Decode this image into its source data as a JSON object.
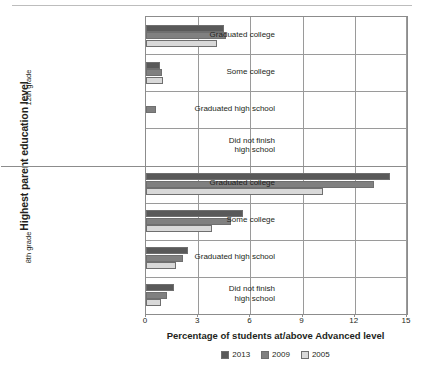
{
  "chart_data": {
    "type": "bar",
    "orientation": "horizontal",
    "title": "",
    "xlabel": "Percentage of students at/above Advanced level",
    "ylabel": "Highest parent education level",
    "xlim": [
      0,
      15
    ],
    "xticks": [
      0,
      3,
      6,
      9,
      12,
      15
    ],
    "xtick_labels": [
      "0",
      "3",
      "6",
      "9",
      "12",
      "15"
    ],
    "grid": "vertical-and-horizontal",
    "legend_position": "bottom-center",
    "group_labels": [
      "12th grade",
      "8th grade"
    ],
    "categories": [
      "Graduated college",
      "Some college",
      "Graduated high school",
      "Did not finish\nhigh school"
    ],
    "groups": [
      {
        "name": "12th grade",
        "categories": [
          "Graduated college",
          "Some college",
          "Graduated high school",
          "Did not finish high school"
        ],
        "series": [
          {
            "name": "2013",
            "color": "#595959",
            "values": [
              4.5,
              0.8,
              0.0,
              0.0
            ]
          },
          {
            "name": "2009",
            "color": "#808080",
            "values": [
              4.6,
              0.9,
              0.6,
              0.0
            ]
          },
          {
            "name": "2005",
            "color": "#d9d9d9",
            "values": [
              4.1,
              1.0,
              0.0,
              0.0
            ]
          }
        ]
      },
      {
        "name": "8th grade",
        "categories": [
          "Graduated college",
          "Some college",
          "Graduated high school",
          "Did not finish high school"
        ],
        "series": [
          {
            "name": "2013",
            "color": "#595959",
            "values": [
              14.0,
              5.6,
              2.4,
              1.6
            ]
          },
          {
            "name": "2009",
            "color": "#808080",
            "values": [
              13.1,
              4.9,
              2.1,
              1.2
            ]
          },
          {
            "name": "2005",
            "color": "#d9d9d9",
            "values": [
              10.2,
              3.8,
              1.7,
              0.85
            ]
          }
        ]
      }
    ],
    "legend": [
      {
        "label": "2013",
        "color": "#595959"
      },
      {
        "label": "2009",
        "color": "#808080"
      },
      {
        "label": "2005",
        "color": "#d9d9d9"
      }
    ]
  },
  "axes": {
    "y_title": "Highest parent education level",
    "x_title": "Percentage of students at/above Advanced level",
    "group_12": "12th grade",
    "group_8": "8th grade"
  },
  "category_labels": {
    "graduated_college": "Graduated college",
    "some_college": "Some college",
    "graduated_high_school": "Graduated high school",
    "did_not_finish_line1": "Did not finish",
    "did_not_finish_line2": "high school"
  }
}
